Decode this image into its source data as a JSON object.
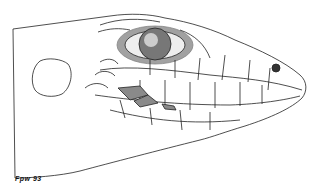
{
  "figure": {
    "signature": "Fpw 93",
    "colors": {
      "ink": "#222222",
      "shaded_scales": "#8a8a8a",
      "background": "#ffffff"
    }
  }
}
